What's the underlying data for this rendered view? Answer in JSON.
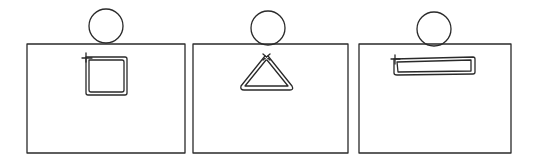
{
  "diagram": {
    "stroke_color": "#2a2a2a",
    "background": "#ffffff",
    "panels": [
      {
        "label": "",
        "shape": "square-wire"
      },
      {
        "label": "",
        "shape": "triangle-wire"
      },
      {
        "label": "",
        "shape": "long-rectangle-wire"
      }
    ]
  }
}
